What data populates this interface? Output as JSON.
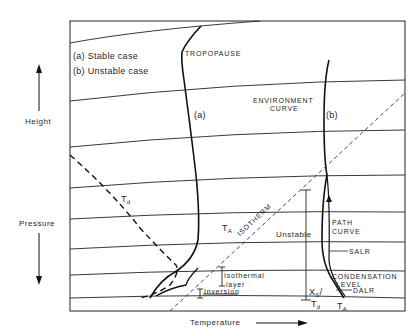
{
  "diagram": {
    "legend": {
      "a": "(a) Stable case",
      "b": "(b) Unstable case"
    },
    "axes": {
      "y_up_label": "Height",
      "y_down_label": "Pressure",
      "x_label": "Temperature"
    },
    "labels": {
      "tropopause": "TROPOPAUSE",
      "environment_curve_1": "ENVIRONMENT",
      "environment_curve_2": "CURVE",
      "curve_a": "(a)",
      "curve_b": "(b)",
      "td_main": "T",
      "td_sub": "d",
      "ta_main": "T",
      "ta_sub": "A",
      "isotherm": "ISOTHERM",
      "unstable": "Unstable",
      "path_curve_1": "PATH",
      "path_curve_2": "CURVE",
      "salr": "SALR",
      "condensation_1": "CONDENSATION",
      "condensation_2": "LEVEL",
      "dalr": "DALR",
      "isothermal_1": "Isothermal",
      "isothermal_2": "layer",
      "inversion": "Inversion",
      "xs_main": "X",
      "xs_sub": "S",
      "td2_main": "T",
      "td2_sub": "d",
      "ta2_main": "T",
      "ta2_sub": "A"
    },
    "colors": {
      "line": "#1a1a1a",
      "background": "#ffffff"
    }
  }
}
